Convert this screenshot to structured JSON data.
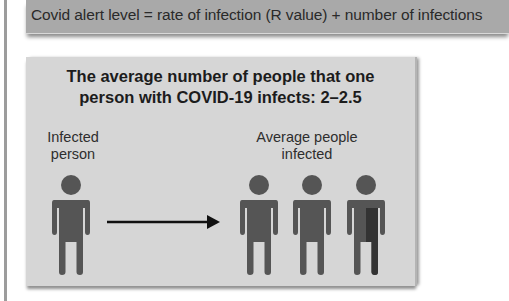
{
  "banner": {
    "text": "Covid alert level = rate of infection (R value) + number of infections"
  },
  "panel": {
    "title_line1": "The average number of people that one",
    "title_line2": "person with COVID-19 infects: 2–2.5",
    "source_label_line1": "Infected",
    "source_label_line2": "person",
    "target_label_line1": "Average people",
    "target_label_line2": "infected",
    "infected_count_full": 2,
    "infected_count_partial_fraction": 0.5
  },
  "colors": {
    "banner_bg": "#a9a9a9",
    "panel_bg": "#d6d6d6",
    "figure": "#555555",
    "figure_partial": "#3a3a3a",
    "arrow": "#111111"
  }
}
